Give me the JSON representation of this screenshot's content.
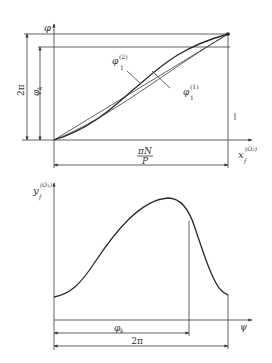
{
  "top_plot": {
    "y_axis_label": "φ",
    "x_axis_label": "x",
    "x_axis_sub": "f",
    "x_axis_sup": "(O₂)",
    "dim_2pi_label": "2π",
    "dim_phik_label": "φ",
    "dim_phik_sub": "k",
    "dim_x_numerator": "πN",
    "dim_x_denominator": "P",
    "curve1_label": "φ",
    "curve1_sub": "1",
    "curve1_sup": "(1)",
    "curve2_label": "φ",
    "curve2_sub": "1",
    "curve2_sup": "(2)"
  },
  "bottom_plot": {
    "y_axis_label": "y",
    "y_axis_sub": "f",
    "y_axis_sup": "(O₁)",
    "x_axis_label": "ψ",
    "dim_phik_label": "φ",
    "dim_phik_sub": "k",
    "dim_2pi_label": "2π"
  },
  "colors": {
    "line": "#3a3a3a",
    "background": "#ffffff"
  }
}
